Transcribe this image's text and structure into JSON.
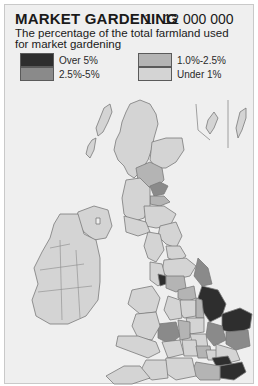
{
  "header": {
    "title": "MARKET GARDENING",
    "scale": "1 : 12 000 000",
    "subtitle": "The percentage of the total farmland used for market gardening"
  },
  "legend": {
    "items": [
      {
        "label": "Over 5%",
        "color": "#2e2e2e"
      },
      {
        "label": "2.5%-5%",
        "color": "#8a8a8a"
      },
      {
        "label": "1.0%-2.5%",
        "color": "#b4b4b4"
      },
      {
        "label": "Under 1%",
        "color": "#d4d4d4"
      }
    ]
  },
  "map": {
    "region": "British Isles",
    "background_color": "#efefef",
    "land_color": "#d4d4d4",
    "border_color": "#7a7a7a",
    "highlighted_areas": [
      {
        "area": "Lincolnshire",
        "category": "Over 5%"
      },
      {
        "area": "Norfolk",
        "category": "Over 5%"
      },
      {
        "area": "Kent",
        "category": "Over 5%"
      },
      {
        "area": "Essex (south)",
        "category": "Over 5%"
      },
      {
        "area": "Lancashire coast",
        "category": "Over 5%"
      },
      {
        "area": "Fife",
        "category": "2.5%-5%"
      },
      {
        "area": "Humberside",
        "category": "2.5%-5%"
      },
      {
        "area": "Cambridgeshire",
        "category": "2.5%-5%"
      },
      {
        "area": "Suffolk",
        "category": "2.5%-5%"
      },
      {
        "area": "Hereford & Worcester",
        "category": "2.5%-5%"
      },
      {
        "area": "Tayside",
        "category": "1.0%-2.5%"
      },
      {
        "area": "Lothian",
        "category": "1.0%-2.5%"
      }
    ]
  }
}
